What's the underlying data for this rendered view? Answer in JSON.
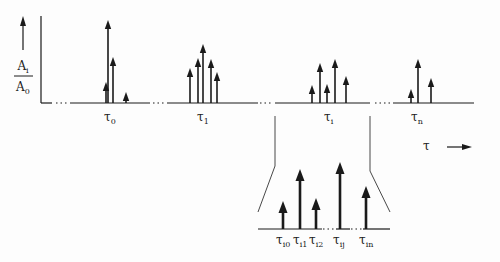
{
  "diagram": {
    "type": "impulse-response-schematic",
    "y_axis": {
      "label_numerator": "A",
      "label_numerator_sub": "i",
      "label_denominator": "A",
      "label_denominator_sub": "0"
    },
    "x_axis": {
      "label": "τ"
    },
    "groups": [
      {
        "label": "τ",
        "sub": "0",
        "x": 110,
        "arrows": [
          {
            "x": 106,
            "top": 82
          },
          {
            "x": 108,
            "top": 20
          },
          {
            "x": 113,
            "top": 57
          },
          {
            "x": 126,
            "top": 92
          }
        ]
      },
      {
        "label": "τ",
        "sub": "1",
        "x": 203,
        "arrows": [
          {
            "x": 190,
            "top": 68
          },
          {
            "x": 198,
            "top": 58
          },
          {
            "x": 203,
            "top": 44
          },
          {
            "x": 211,
            "top": 59
          },
          {
            "x": 217,
            "top": 72
          }
        ]
      },
      {
        "label": "τ",
        "sub": "i",
        "x": 330,
        "arrows": [
          {
            "x": 312,
            "top": 85
          },
          {
            "x": 320,
            "top": 63
          },
          {
            "x": 327,
            "top": 84
          },
          {
            "x": 335,
            "top": 59
          },
          {
            "x": 346,
            "top": 76
          }
        ]
      },
      {
        "label": "τ",
        "sub": "n",
        "x": 417,
        "arrows": [
          {
            "x": 411,
            "top": 89
          },
          {
            "x": 418,
            "top": 59
          },
          {
            "x": 431,
            "top": 78
          }
        ]
      }
    ],
    "zoom_inset": {
      "arrows": [
        {
          "x": 283,
          "top": 201
        },
        {
          "x": 300,
          "top": 169
        },
        {
          "x": 316,
          "top": 198
        },
        {
          "x": 340,
          "top": 162
        },
        {
          "x": 366,
          "top": 186
        }
      ],
      "labels": [
        {
          "label": "τ",
          "sub": "i0"
        },
        {
          "label": "τ",
          "sub": "i1"
        },
        {
          "label": "τ",
          "sub": "i2"
        },
        {
          "label": "τ",
          "sub": "ij"
        },
        {
          "label": "τ",
          "sub": "in"
        }
      ]
    },
    "line_color": "#1a1a1a"
  }
}
